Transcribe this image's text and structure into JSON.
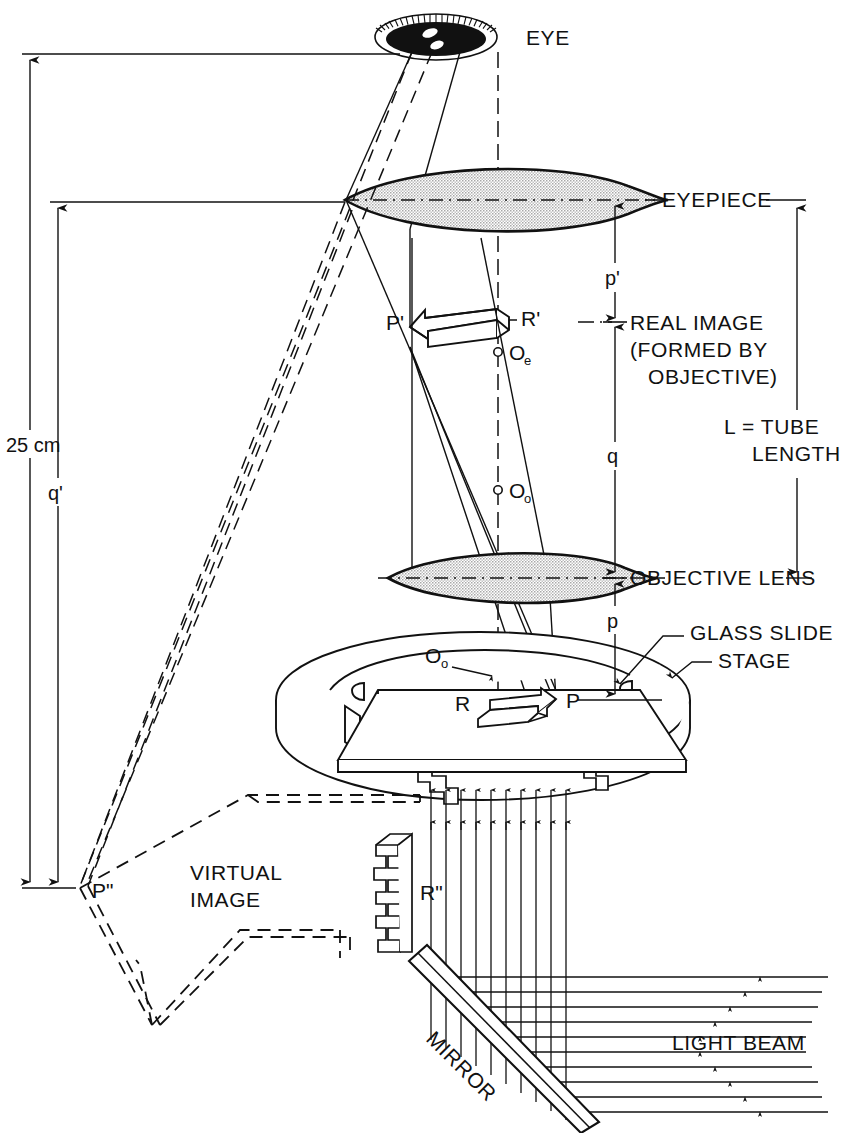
{
  "figure": {
    "domain": "diagram",
    "colors": {
      "ink": "#111111",
      "lens_fill": "#c9c9c9",
      "background": "#ffffff"
    }
  },
  "labels": {
    "eye": "EYE",
    "eyepiece": "EYEPIECE",
    "real_image_line1": "REAL IMAGE",
    "real_image_line2": "(FORMED BY",
    "real_image_line3": "OBJECTIVE)",
    "tube_length_line1": "L = TUBE",
    "tube_length_line2": "LENGTH",
    "objective_lens": "OBJECTIVE LENS",
    "glass_slide": "GLASS SLIDE",
    "stage": "STAGE",
    "virtual_image_line1": "VIRTUAL",
    "virtual_image_line2": "IMAGE",
    "mirror": "MIRROR",
    "light_beam": "LIGHT BEAM"
  },
  "dimensions": {
    "near_point": "25 cm",
    "q_prime": "q'",
    "p_prime": "p'",
    "q": "q",
    "p": "p"
  },
  "points": {
    "object_tip": "P",
    "object_tail": "R",
    "real_image_tip": "P'",
    "real_image_tail": "R'",
    "virtual_image_tip": "P\"",
    "virtual_image_tail": "R\"",
    "objective_center": "O",
    "objective_center_sub": "o",
    "eyepiece_center": "O",
    "eyepiece_center_sub": "e",
    "objective_center_stage": "O",
    "objective_center_stage_sub": "o"
  }
}
